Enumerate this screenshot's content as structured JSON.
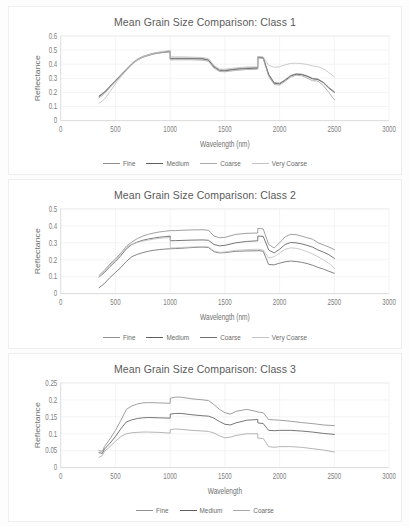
{
  "charts": [
    {
      "id": "class-1",
      "title": "Mean Grain Size Comparison: Class 1",
      "xlabel": "Wavelength (nm)",
      "ylabel": "Reflectance",
      "xticks": [
        "0",
        "500",
        "1000",
        "1500",
        "2000",
        "2500",
        "3000"
      ],
      "yticks": [
        "0",
        "0.1",
        "0.2",
        "0.3",
        "0.4",
        "0.5",
        "0.6"
      ],
      "legend": [
        {
          "label": "Fine",
          "color": "#8f8f8f"
        },
        {
          "label": "Medium",
          "color": "#5e5e5e"
        },
        {
          "label": "Coarse",
          "color": "#a8a8a8"
        },
        {
          "label": "Very Coarse",
          "color": "#c2c2c2"
        }
      ]
    },
    {
      "id": "class-2",
      "title": "Mean Grain Size Comparison: Class 2",
      "xlabel": "Wavelength (nm)",
      "ylabel": "Reflectance",
      "xticks": [
        "0",
        "500",
        "1000",
        "1500",
        "2000",
        "2500",
        "3000"
      ],
      "yticks": [
        "0",
        "0.1",
        "0.2",
        "0.3",
        "0.4",
        "0.5"
      ],
      "legend": [
        {
          "label": "Fine",
          "color": "#8f8f8f"
        },
        {
          "label": "Medium",
          "color": "#5e5e5e"
        },
        {
          "label": "Coarse",
          "color": "#6e6e6e"
        },
        {
          "label": "Very Coarse",
          "color": "#c2c2c2"
        }
      ]
    },
    {
      "id": "class-3",
      "title": "Mean Grain Size Comparison: Class 3",
      "xlabel": "Wavelength",
      "ylabel": "Reflectance",
      "xticks": [
        "0",
        "500",
        "1000",
        "1500",
        "2000",
        "2500",
        "3000"
      ],
      "yticks": [
        "0",
        "0.05",
        "0.1",
        "0.15",
        "0.2",
        "0.25"
      ],
      "legend": [
        {
          "label": "Fine",
          "color": "#8f8f8f"
        },
        {
          "label": "Medium",
          "color": "#5e5e5e"
        },
        {
          "label": "Coarse",
          "color": "#a8a8a8"
        }
      ]
    }
  ],
  "chart_data": [
    {
      "type": "line",
      "title": "Mean Grain Size Comparison: Class 1",
      "xlabel": "Wavelength (nm)",
      "ylabel": "Reflectance",
      "xlim": [
        0,
        3000
      ],
      "ylim": [
        0,
        0.6
      ],
      "xticks": [
        0,
        500,
        1000,
        1500,
        2000,
        2500,
        3000
      ],
      "yticks": [
        0,
        0.1,
        0.2,
        0.3,
        0.4,
        0.5,
        0.6
      ],
      "grid": "horizontal+vertical",
      "legend_position": "bottom",
      "x": [
        350,
        400,
        450,
        500,
        550,
        600,
        650,
        700,
        750,
        800,
        850,
        900,
        950,
        1000,
        1001,
        1050,
        1100,
        1200,
        1300,
        1350,
        1400,
        1450,
        1500,
        1600,
        1700,
        1800,
        1801,
        1850,
        1900,
        1950,
        2000,
        2050,
        2100,
        2150,
        2200,
        2250,
        2300,
        2350,
        2400,
        2450,
        2500
      ],
      "series": [
        {
          "name": "Fine",
          "color": "#8f8f8f",
          "values": [
            0.175,
            0.205,
            0.245,
            0.285,
            0.325,
            0.365,
            0.405,
            0.435,
            0.455,
            0.468,
            0.478,
            0.484,
            0.488,
            0.492,
            0.442,
            0.443,
            0.443,
            0.443,
            0.44,
            0.432,
            0.385,
            0.36,
            0.358,
            0.368,
            0.374,
            0.376,
            0.452,
            0.448,
            0.33,
            0.27,
            0.265,
            0.29,
            0.32,
            0.332,
            0.33,
            0.318,
            0.3,
            0.295,
            0.272,
            0.235,
            0.205
          ]
        },
        {
          "name": "Medium",
          "color": "#5e5e5e",
          "values": [
            0.17,
            0.2,
            0.24,
            0.28,
            0.32,
            0.36,
            0.4,
            0.43,
            0.45,
            0.463,
            0.473,
            0.48,
            0.484,
            0.488,
            0.438,
            0.439,
            0.439,
            0.439,
            0.436,
            0.428,
            0.38,
            0.355,
            0.353,
            0.363,
            0.369,
            0.371,
            0.448,
            0.444,
            0.325,
            0.265,
            0.26,
            0.285,
            0.315,
            0.328,
            0.326,
            0.314,
            0.296,
            0.291,
            0.268,
            0.23,
            0.2
          ]
        },
        {
          "name": "Coarse",
          "color": "#a8a8a8",
          "values": [
            0.16,
            0.192,
            0.235,
            0.276,
            0.318,
            0.358,
            0.398,
            0.428,
            0.448,
            0.461,
            0.472,
            0.479,
            0.484,
            0.489,
            0.43,
            0.431,
            0.431,
            0.431,
            0.428,
            0.42,
            0.372,
            0.348,
            0.346,
            0.356,
            0.362,
            0.364,
            0.444,
            0.44,
            0.312,
            0.256,
            0.252,
            0.278,
            0.308,
            0.322,
            0.318,
            0.303,
            0.283,
            0.28,
            0.248,
            0.2,
            0.148
          ]
        },
        {
          "name": "Very Coarse",
          "color": "#c2c2c2",
          "values": [
            0.122,
            0.152,
            0.205,
            0.262,
            0.312,
            0.355,
            0.398,
            0.43,
            0.452,
            0.466,
            0.477,
            0.485,
            0.492,
            0.498,
            0.452,
            0.452,
            0.452,
            0.45,
            0.447,
            0.44,
            0.392,
            0.366,
            0.364,
            0.374,
            0.38,
            0.382,
            0.455,
            0.452,
            0.392,
            0.378,
            0.382,
            0.395,
            0.405,
            0.407,
            0.404,
            0.398,
            0.388,
            0.382,
            0.368,
            0.34,
            0.31
          ]
        }
      ]
    },
    {
      "type": "line",
      "title": "Mean Grain Size Comparison: Class 2",
      "xlabel": "Wavelength (nm)",
      "ylabel": "Reflectance",
      "xlim": [
        0,
        3000
      ],
      "ylim": [
        0,
        0.5
      ],
      "xticks": [
        0,
        500,
        1000,
        1500,
        2000,
        2500,
        3000
      ],
      "yticks": [
        0,
        0.1,
        0.2,
        0.3,
        0.4,
        0.5
      ],
      "grid": "horizontal+vertical",
      "legend_position": "bottom",
      "x": [
        350,
        400,
        450,
        500,
        550,
        600,
        650,
        700,
        750,
        800,
        850,
        900,
        950,
        1000,
        1001,
        1050,
        1100,
        1200,
        1300,
        1350,
        1400,
        1450,
        1500,
        1600,
        1700,
        1800,
        1801,
        1850,
        1900,
        1950,
        2000,
        2050,
        2100,
        2150,
        2200,
        2250,
        2300,
        2350,
        2400,
        2450,
        2500
      ],
      "series": [
        {
          "name": "Fine",
          "color": "#8f8f8f",
          "values": [
            0.108,
            0.138,
            0.175,
            0.205,
            0.24,
            0.28,
            0.305,
            0.325,
            0.34,
            0.35,
            0.358,
            0.364,
            0.368,
            0.372,
            0.372,
            0.372,
            0.374,
            0.376,
            0.377,
            0.374,
            0.34,
            0.33,
            0.332,
            0.35,
            0.356,
            0.358,
            0.385,
            0.382,
            0.29,
            0.27,
            0.3,
            0.335,
            0.35,
            0.348,
            0.34,
            0.33,
            0.322,
            0.3,
            0.288,
            0.275,
            0.26
          ]
        },
        {
          "name": "Medium",
          "color": "#5e5e5e",
          "values": [
            0.098,
            0.125,
            0.16,
            0.19,
            0.225,
            0.265,
            0.29,
            0.305,
            0.315,
            0.322,
            0.328,
            0.333,
            0.336,
            0.34,
            0.312,
            0.313,
            0.314,
            0.316,
            0.317,
            0.315,
            0.29,
            0.282,
            0.285,
            0.3,
            0.308,
            0.312,
            0.34,
            0.338,
            0.258,
            0.24,
            0.262,
            0.29,
            0.302,
            0.3,
            0.294,
            0.285,
            0.275,
            0.258,
            0.245,
            0.23,
            0.208
          ]
        },
        {
          "name": "Coarse",
          "color": "#6e6e6e",
          "values": [
            0.035,
            0.06,
            0.095,
            0.125,
            0.155,
            0.19,
            0.218,
            0.232,
            0.242,
            0.25,
            0.256,
            0.26,
            0.263,
            0.265,
            0.265,
            0.266,
            0.268,
            0.272,
            0.275,
            0.272,
            0.248,
            0.24,
            0.242,
            0.25,
            0.252,
            0.253,
            0.255,
            0.25,
            0.172,
            0.17,
            0.18,
            0.188,
            0.192,
            0.19,
            0.185,
            0.178,
            0.168,
            0.155,
            0.145,
            0.132,
            0.12
          ]
        },
        {
          "name": "Very Coarse",
          "color": "#c2c2c2",
          "values": [
            0.1,
            0.13,
            0.17,
            0.2,
            0.235,
            0.276,
            0.292,
            0.302,
            0.31,
            0.316,
            0.322,
            0.326,
            0.329,
            0.332,
            0.27,
            0.271,
            0.272,
            0.276,
            0.278,
            0.276,
            0.252,
            0.244,
            0.246,
            0.256,
            0.26,
            0.262,
            0.262,
            0.258,
            0.21,
            0.218,
            0.24,
            0.262,
            0.27,
            0.268,
            0.26,
            0.248,
            0.235,
            0.218,
            0.2,
            0.178,
            0.15
          ]
        }
      ]
    },
    {
      "type": "line",
      "title": "Mean Grain Size Comparison: Class 3",
      "xlabel": "Wavelength",
      "ylabel": "Reflectance",
      "xlim": [
        0,
        3000
      ],
      "ylim": [
        0,
        0.25
      ],
      "xticks": [
        0,
        500,
        1000,
        1500,
        2000,
        2500,
        3000
      ],
      "yticks": [
        0,
        0.05,
        0.1,
        0.15,
        0.2,
        0.25
      ],
      "grid": "horizontal+vertical",
      "legend_position": "bottom",
      "x": [
        350,
        380,
        400,
        450,
        500,
        550,
        600,
        650,
        700,
        750,
        800,
        900,
        1000,
        1001,
        1050,
        1100,
        1200,
        1300,
        1350,
        1400,
        1450,
        1500,
        1550,
        1600,
        1700,
        1800,
        1801,
        1850,
        1900,
        1950,
        2000,
        2100,
        2200,
        2300,
        2400,
        2500
      ],
      "series": [
        {
          "name": "Fine",
          "color": "#8f8f8f",
          "values": [
            0.05,
            0.048,
            0.062,
            0.085,
            0.11,
            0.14,
            0.172,
            0.182,
            0.188,
            0.191,
            0.192,
            0.191,
            0.19,
            0.205,
            0.208,
            0.208,
            0.203,
            0.2,
            0.198,
            0.186,
            0.172,
            0.162,
            0.158,
            0.166,
            0.172,
            0.165,
            0.164,
            0.162,
            0.142,
            0.141,
            0.14,
            0.137,
            0.133,
            0.13,
            0.126,
            0.124
          ]
        },
        {
          "name": "Medium",
          "color": "#5e5e5e",
          "values": [
            0.044,
            0.042,
            0.055,
            0.072,
            0.092,
            0.115,
            0.135,
            0.141,
            0.145,
            0.147,
            0.148,
            0.147,
            0.146,
            0.158,
            0.16,
            0.16,
            0.156,
            0.153,
            0.152,
            0.146,
            0.136,
            0.128,
            0.126,
            0.132,
            0.14,
            0.142,
            0.132,
            0.13,
            0.11,
            0.109,
            0.11,
            0.11,
            0.108,
            0.105,
            0.101,
            0.098
          ]
        },
        {
          "name": "Coarse",
          "color": "#a8a8a8",
          "values": [
            0.03,
            0.036,
            0.048,
            0.062,
            0.078,
            0.092,
            0.1,
            0.103,
            0.104,
            0.105,
            0.105,
            0.104,
            0.102,
            0.112,
            0.114,
            0.113,
            0.11,
            0.108,
            0.107,
            0.102,
            0.094,
            0.088,
            0.09,
            0.095,
            0.1,
            0.1,
            0.087,
            0.086,
            0.062,
            0.06,
            0.062,
            0.062,
            0.06,
            0.056,
            0.052,
            0.046
          ]
        }
      ]
    }
  ]
}
